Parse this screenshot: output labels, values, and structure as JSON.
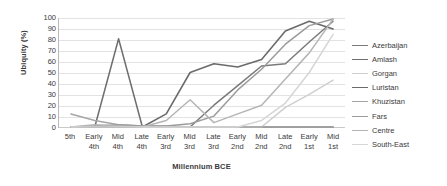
{
  "chart_data": {
    "type": "line",
    "title": "",
    "xlabel": "Millennium BCE",
    "ylabel": "Ubiquity (%)",
    "ylim": [
      0,
      100
    ],
    "ytick_step": 10,
    "grid": true,
    "legend_position": "right",
    "categories": [
      {
        "top": "5th",
        "bottom": ""
      },
      {
        "top": "Early",
        "bottom": "4th"
      },
      {
        "top": "Mid",
        "bottom": "4th"
      },
      {
        "top": "Late",
        "bottom": "4th"
      },
      {
        "top": "Early",
        "bottom": "3rd"
      },
      {
        "top": "Mid",
        "bottom": "3rd"
      },
      {
        "top": "Late",
        "bottom": "3rd"
      },
      {
        "top": "Early",
        "bottom": "2nd"
      },
      {
        "top": "Mid",
        "bottom": "2nd"
      },
      {
        "top": "Late",
        "bottom": "2nd"
      },
      {
        "top": "Early",
        "bottom": "1st"
      },
      {
        "top": "Mid",
        "bottom": "1st"
      }
    ],
    "ytick_labels": [
      "100",
      "90",
      "80",
      "70",
      "60",
      "50",
      "40",
      "30",
      "20",
      "10",
      "0"
    ],
    "series": [
      {
        "name": "Azerbaijan",
        "color": "#7a7a7a",
        "width": 1.5,
        "values": [
          0,
          0,
          0,
          0,
          0,
          0,
          20,
          38,
          56,
          58,
          78,
          97
        ]
      },
      {
        "name": "Amlash",
        "color": "#6e6e6e",
        "width": 1.5,
        "values": [
          0,
          0,
          81,
          0,
          0,
          0,
          0,
          0,
          0,
          0,
          0,
          0
        ]
      },
      {
        "name": "Gorgan",
        "color": "#cfcfcf",
        "width": 1.5,
        "values": [
          0,
          0,
          0,
          0,
          0,
          0,
          0,
          0,
          0,
          18,
          30,
          43
        ]
      },
      {
        "name": "Luristan",
        "color": "#6b6b6b",
        "width": 1.6,
        "values": [
          0,
          0,
          0,
          0,
          12,
          50,
          58,
          55,
          62,
          88,
          97,
          90
        ]
      },
      {
        "name": "Khuzistan",
        "color": "#a6a6a6",
        "width": 1.5,
        "values": [
          12,
          6,
          2,
          1,
          1,
          0,
          0,
          0,
          0,
          0,
          0,
          0
        ]
      },
      {
        "name": "Fars",
        "color": "#9c9c9c",
        "width": 1.5,
        "values": [
          0,
          1,
          2,
          1,
          1,
          3,
          10,
          34,
          53,
          76,
          93,
          99
        ]
      },
      {
        "name": "Centre",
        "color": "#b5b5b5",
        "width": 1.5,
        "values": [
          0,
          2,
          1,
          0,
          6,
          25,
          4,
          12,
          20,
          44,
          68,
          99
        ]
      },
      {
        "name": "South-East",
        "color": "#d6d6d6",
        "width": 1.5,
        "values": [
          0,
          0,
          0,
          0,
          0,
          0,
          0,
          0,
          6,
          22,
          50,
          85
        ]
      }
    ]
  }
}
